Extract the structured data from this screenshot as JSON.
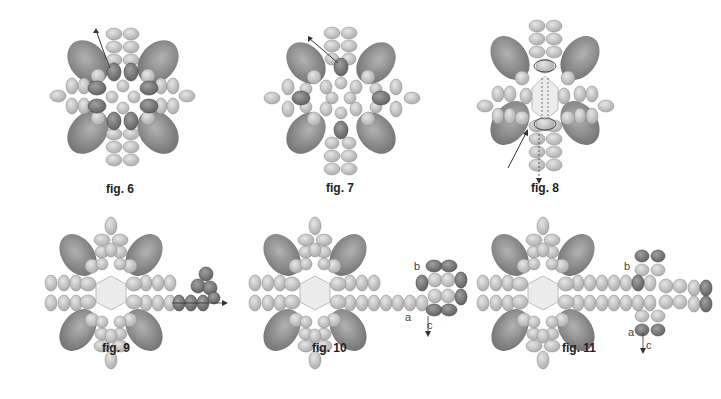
{
  "figures": [
    {
      "id": "fig6",
      "caption": "fig. 6",
      "description": "Bead cluster with highlighted (dark) center beads and thread path arrow exiting top-left"
    },
    {
      "id": "fig7",
      "caption": "fig. 7",
      "description": "Bead cluster with four dark single beads added in each direction and thread path arrow"
    },
    {
      "id": "fig8",
      "caption": "fig. 8",
      "description": "Bead cluster with center crystal, thread loops and arrow exiting bottom"
    },
    {
      "id": "fig9",
      "caption": "fig. 9",
      "description": "Completed cluster with arm extending right, small dark bead loop and arrow"
    },
    {
      "id": "fig10",
      "caption": "fig. 10",
      "description": "Completed cluster with right arm and dark bead square unit",
      "labels": [
        "a",
        "b",
        "c"
      ]
    },
    {
      "id": "fig11",
      "caption": "fig. 11",
      "description": "Completed cluster with extended arm and cross-shaped bead unit",
      "labels": [
        "a",
        "b",
        "c"
      ]
    }
  ],
  "colors": {
    "light_bead": "#c4c4c4",
    "dark_bead": "#7a7a7a",
    "big_drop": "#8c8c8c",
    "crystal": "#ececec",
    "thread": "#333333",
    "caption_text": "#222222"
  }
}
